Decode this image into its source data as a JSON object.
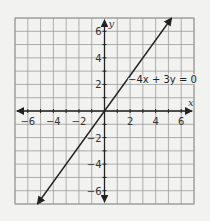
{
  "chart_data": {
    "type": "line",
    "title": "",
    "xlabel": "x",
    "ylabel": "y",
    "xlim": [
      -7,
      7
    ],
    "ylim": [
      -7,
      7
    ],
    "grid": true,
    "x_ticks": [
      -6,
      -4,
      -2,
      2,
      4,
      6
    ],
    "y_ticks": [
      6,
      4,
      2,
      -2,
      -4,
      -6
    ],
    "x_tick_labels": [
      "−6",
      "−4",
      "−2",
      "2",
      "4",
      "6"
    ],
    "y_tick_labels": [
      "6",
      "4",
      "2",
      "−2",
      "−4",
      "−6"
    ],
    "series": [
      {
        "name": "−4x + 3y = 0",
        "equation": "-4x + 3y = 0",
        "slope": 1.3333,
        "intercept": 0,
        "x": [
          -5.25,
          5.25
        ],
        "y": [
          -7,
          7
        ],
        "arrows": "both"
      }
    ],
    "annotations": [
      {
        "text": "−4x + 3y = 0",
        "x": 2,
        "y": 2.3
      }
    ],
    "colors": {
      "grid": "#9a9a9a",
      "axis": "#222222",
      "line": "#222222",
      "background": "#f2f2f0"
    }
  },
  "labels": {
    "x_axis": "x",
    "y_axis": "y",
    "equation": "−4x + 3y = 0"
  }
}
